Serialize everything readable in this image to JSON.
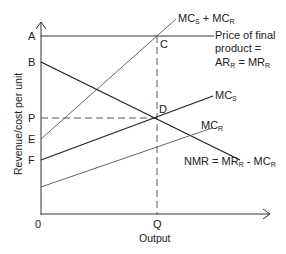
{
  "diagram": {
    "axes": {
      "y_label": "Revenue/cost per unit",
      "x_label": "Output",
      "origin_label": "0"
    },
    "y_ticks": {
      "a": "A",
      "b": "B",
      "p": "P",
      "e": "E",
      "f": "F"
    },
    "x_ticks": {
      "q": "Q"
    },
    "points": {
      "c": "C",
      "d": "D"
    },
    "curves": {
      "mcs_plus_mcr": {
        "main1": "MC",
        "sub1": "S",
        "mid": " + MC",
        "sub2": "R"
      },
      "price": {
        "line1": "Price of final",
        "line2": "product =",
        "line3_a": "AR",
        "line3_sub1": "R",
        "line3_b": " = MR",
        "line3_sub2": "R"
      },
      "mcs": {
        "main": "MC",
        "sub": "S"
      },
      "mcr": {
        "main": "MC",
        "sub": "R"
      },
      "nmr": {
        "a": "NMR = MR",
        "sub1": "R",
        "b": " - MC",
        "sub2": "R"
      }
    },
    "colors": {
      "ink": "#222222",
      "thin_line": "#555555"
    }
  }
}
